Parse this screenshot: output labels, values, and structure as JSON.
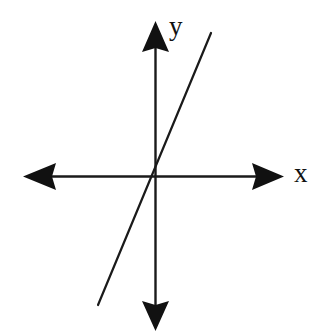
{
  "figure": {
    "background_color": "#ffffff",
    "stroke_color": "#1a1a1a",
    "width": 330,
    "height": 334
  },
  "labels": {
    "x_axis": "x",
    "y_axis": "y"
  },
  "chart_data": {
    "type": "line",
    "title": "",
    "xlabel": "x",
    "ylabel": "y",
    "grid": false,
    "legend": false,
    "axes": {
      "origin_px": [
        155,
        176
      ],
      "x_axis": {
        "label": "x",
        "double_headed": true,
        "start_px": [
          24,
          176
        ],
        "end_px": [
          283,
          176
        ],
        "arrow_left": true,
        "arrow_right": true
      },
      "y_axis": {
        "label": "y",
        "double_headed": true,
        "start_px": [
          155,
          22
        ],
        "end_px": [
          155,
          330
        ],
        "arrow_up": true,
        "arrow_down": true
      }
    },
    "series": [
      {
        "name": "line through origin",
        "description": "Straight line with positive slope passing through the origin",
        "endpoints_px": [
          [
            98,
            305
          ],
          [
            211,
            33
          ]
        ],
        "passes_through_origin": true,
        "slope_sign": "positive",
        "slope_estimate": 2.4,
        "x": [
          -1.0,
          0.0,
          1.0
        ],
        "y": [
          -2.4,
          0.0,
          2.4
        ]
      }
    ],
    "annotations": []
  }
}
